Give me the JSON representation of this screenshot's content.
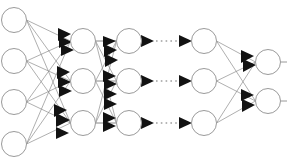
{
  "diagram": {
    "type": "neural-network-graph",
    "background_color": "#ffffff",
    "node_fill_color": "#ffffff",
    "node_stroke_color": "#9a9a9a",
    "edge_color": "#8d8d8d",
    "arrow_color": "#121212",
    "ellipsis_color": "#6e6e6e",
    "canvas": {
      "width": 287,
      "height": 168
    },
    "node_radius": 12.5,
    "layers": [
      {
        "id": "layer-input",
        "name": "input-layer",
        "label": "",
        "x": 14,
        "node_count": 4,
        "nodes": [
          {
            "id": "in-1",
            "cx": 14,
            "cy": 20
          },
          {
            "id": "in-2",
            "cx": 14,
            "cy": 61
          },
          {
            "id": "in-3",
            "cx": 14,
            "cy": 102
          },
          {
            "id": "in-4",
            "cx": 14,
            "cy": 144
          }
        ]
      },
      {
        "id": "layer-hidden-1",
        "name": "hidden-layer-1",
        "label": "",
        "x": 83,
        "node_count": 3,
        "nodes": [
          {
            "id": "h1-1",
            "cx": 83,
            "cy": 41
          },
          {
            "id": "h1-2",
            "cx": 83,
            "cy": 81
          },
          {
            "id": "h1-3",
            "cx": 83,
            "cy": 123
          }
        ]
      },
      {
        "id": "layer-hidden-2",
        "name": "hidden-layer-2",
        "label": "",
        "x": 129,
        "node_count": 3,
        "nodes": [
          {
            "id": "h2-1",
            "cx": 129,
            "cy": 41
          },
          {
            "id": "h2-2",
            "cx": 129,
            "cy": 81
          },
          {
            "id": "h2-3",
            "cx": 129,
            "cy": 123
          }
        ]
      },
      {
        "id": "layer-hidden-n",
        "name": "hidden-layer-n",
        "label": "",
        "x": 204,
        "node_count": 3,
        "nodes": [
          {
            "id": "hn-1",
            "cx": 204,
            "cy": 41
          },
          {
            "id": "hn-2",
            "cx": 204,
            "cy": 81
          },
          {
            "id": "hn-3",
            "cx": 204,
            "cy": 123
          }
        ]
      },
      {
        "id": "layer-output",
        "name": "output-layer",
        "label": "",
        "x": 268,
        "node_count": 2,
        "nodes": [
          {
            "id": "out-1",
            "cx": 268,
            "cy": 62
          },
          {
            "id": "out-2",
            "cx": 268,
            "cy": 101
          }
        ]
      }
    ],
    "connection_groups": [
      {
        "id": "conn-input-h1",
        "from": "layer-input",
        "to": "layer-hidden-1",
        "pattern": "fully-connected",
        "edge_count": 12,
        "arrowheads": true
      },
      {
        "id": "conn-h1-h2",
        "from": "layer-hidden-1",
        "to": "layer-hidden-2",
        "pattern": "fully-connected",
        "edge_count": 9,
        "arrowheads": true
      },
      {
        "id": "conn-h2-hn",
        "from": "layer-hidden-2",
        "to": "layer-hidden-n",
        "pattern": "one-to-one-dotted",
        "edge_count": 3,
        "arrowheads": true
      },
      {
        "id": "conn-hn-output",
        "from": "layer-hidden-n",
        "to": "layer-output",
        "pattern": "fully-connected",
        "edge_count": 6,
        "arrowheads": true
      }
    ],
    "ellipsis_rows": [
      {
        "id": "ellipsis-row-1",
        "y": 41,
        "x_start": 147,
        "x_end": 186,
        "dot_count": 4
      },
      {
        "id": "ellipsis-row-2",
        "y": 81,
        "x_start": 147,
        "x_end": 186,
        "dot_count": 4
      },
      {
        "id": "ellipsis-row-3",
        "y": 123,
        "x_start": 147,
        "x_end": 186,
        "dot_count": 4
      }
    ],
    "output_stubs": [
      {
        "id": "out-stub-1",
        "x_start": 280,
        "x_end": 287,
        "y": 62
      },
      {
        "id": "out-stub-2",
        "x_start": 280,
        "x_end": 287,
        "y": 101
      }
    ]
  }
}
